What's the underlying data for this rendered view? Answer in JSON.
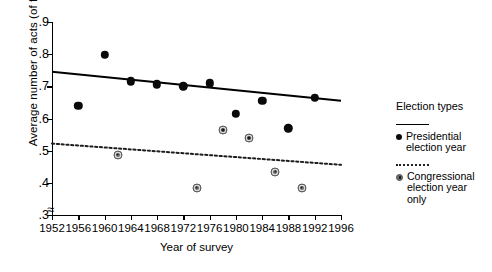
{
  "chart_data": {
    "type": "scatter",
    "title": "",
    "xlabel": "Year of survey",
    "ylabel": "Average number of acts (of five)",
    "xlim": [
      1952,
      1996
    ],
    "ylim": [
      0.3,
      0.9
    ],
    "xticks": [
      1952,
      1956,
      1960,
      1964,
      1968,
      1972,
      1976,
      1980,
      1984,
      1988,
      1992,
      1996
    ],
    "xtick_labels": [
      "1952",
      "1956",
      "1960",
      "1964",
      "1968",
      "1972",
      "1976",
      "1980",
      "1984",
      "1988",
      "1992",
      "1996"
    ],
    "yticks": [
      0.3,
      0.4,
      0.5,
      0.6,
      0.7,
      0.8,
      0.9
    ],
    "ytick_labels": [
      ".3",
      ".4",
      ".5",
      ".6",
      ".7",
      ".8",
      ".9"
    ],
    "y_axis_break": true,
    "grid": false,
    "legend_position": "right",
    "series": [
      {
        "name": "Presidential election year",
        "marker": "filled-circle",
        "line": "solid",
        "x": [
          1956,
          1960,
          1964,
          1968,
          1972,
          1976,
          1980,
          1984,
          1988,
          1992
        ],
        "y": [
          0.64,
          0.798,
          0.716,
          0.706,
          0.7,
          0.71,
          0.615,
          0.655,
          0.57,
          0.665
        ],
        "trend_line": {
          "x": [
            1952,
            1996
          ],
          "y": [
            0.745,
            0.655
          ]
        }
      },
      {
        "name": "Congressional election year only",
        "marker": "ringed-circle",
        "line": "dotted",
        "x": [
          1962,
          1974,
          1978,
          1982,
          1986,
          1990
        ],
        "y": [
          0.488,
          0.385,
          0.565,
          0.54,
          0.435,
          0.385
        ],
        "trend_line": {
          "x": [
            1952,
            1996
          ],
          "y": [
            0.522,
            0.456
          ]
        }
      }
    ]
  },
  "legend": {
    "title": "Election types",
    "entries": [
      {
        "label_line1": "Presidential",
        "label_line2": "election year",
        "label_line3": ""
      },
      {
        "label_line1": "Congressional",
        "label_line2": "election year",
        "label_line3": "only"
      }
    ]
  },
  "axis_break_glyph": "≈"
}
